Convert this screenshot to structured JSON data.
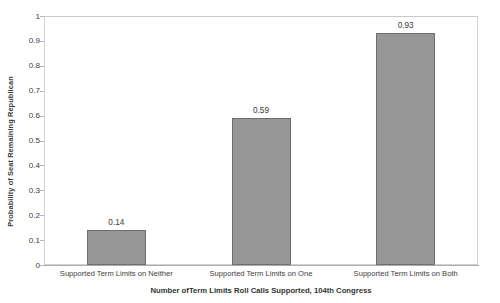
{
  "chart_data": {
    "type": "bar",
    "title": "",
    "subtitle": "",
    "categories": [
      "Supported Term Limits on Neither",
      "Supported Term Limits on One",
      "Supported Term Limits on Both"
    ],
    "values": [
      0.14,
      0.59,
      0.93
    ],
    "data_labels": [
      "0.14",
      "0.59",
      "0.93"
    ],
    "xlabel": "Number ofTerm Limits Roll Calls Supported, 104th Congress",
    "ylabel": "Probability of Seat Remaining Republican",
    "ylim": [
      0,
      1
    ],
    "ytick_labels": [
      "1",
      "0.9",
      "0.8",
      "0.7",
      "0.6",
      "0.5",
      "0.4",
      "0.3",
      "0.2",
      "0.1",
      "0"
    ],
    "ytick_values": [
      1,
      0.9,
      0.8,
      0.7,
      0.6,
      0.5,
      0.4,
      0.3,
      0.2,
      0.1,
      0
    ],
    "grid": false,
    "legend": false,
    "legend_position": "none",
    "bar_color": "#969696",
    "bar_border_color": "#6e6e6e",
    "plot_border_color": "#d2d2d2",
    "background_color": "#ffffff",
    "text_color": "#3a3a3a"
  }
}
